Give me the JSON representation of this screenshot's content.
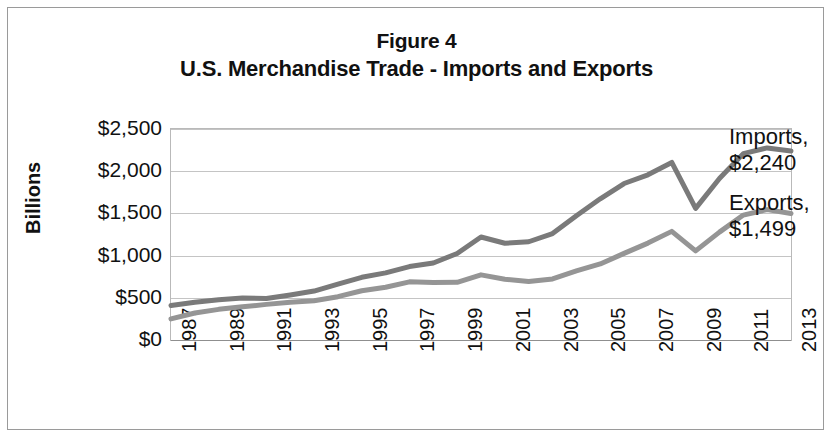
{
  "figure": {
    "title_line_1": "Figure 4",
    "title_line_2": "U.S. Merchandise Trade - Imports and Exports"
  },
  "axes": {
    "y_label": "Billions",
    "y_ticks": [
      "$0",
      "$500",
      "$1,000",
      "$1,500",
      "$2,000",
      "$2,500"
    ],
    "x_ticks": [
      "1987",
      "1989",
      "1991",
      "1993",
      "1995",
      "1997",
      "1999",
      "2001",
      "2003",
      "2005",
      "2007",
      "2009",
      "2011",
      "2013"
    ]
  },
  "callouts": {
    "imports_name": "Imports,",
    "imports_value": "$2,240",
    "exports_name": "Exports,",
    "exports_value": "$1,499"
  },
  "colors": {
    "imports_line": "#7a7a7a",
    "exports_line": "#959595",
    "gridline": "#c4c4c4",
    "plot_border": "#b9b9b9",
    "outer_border": "#9a9a9a",
    "text": "#111111"
  },
  "chart_data": {
    "type": "line",
    "xlabel": "",
    "ylabel": "Billions",
    "ylim": [
      0,
      2500
    ],
    "y_tick_step": 500,
    "grid": true,
    "legend": "data-labels-at-line-end",
    "x": [
      1987,
      1988,
      1989,
      1990,
      1991,
      1992,
      1993,
      1994,
      1995,
      1996,
      1997,
      1998,
      1999,
      2000,
      2001,
      2002,
      2003,
      2004,
      2005,
      2006,
      2007,
      2008,
      2009,
      2010,
      2011,
      2012,
      2013
    ],
    "series": [
      {
        "name": "Imports",
        "color": "#7a7a7a",
        "end_label": "Imports, $2,240",
        "values": [
          410,
          447,
          477,
          498,
          491,
          533,
          580,
          663,
          743,
          795,
          870,
          912,
          1025,
          1220,
          1146,
          1164,
          1261,
          1473,
          1673,
          1854,
          1957,
          2104,
          1559,
          1913,
          2208,
          2276,
          2240
        ]
      },
      {
        "name": "Exports",
        "color": "#959595",
        "end_label": "Exports, $1,499",
        "values": [
          250,
          320,
          363,
          393,
          422,
          448,
          465,
          513,
          584,
          625,
          689,
          682,
          684,
          772,
          719,
          693,
          724,
          818,
          901,
          1026,
          1148,
          1287,
          1056,
          1278,
          1480,
          1545,
          1499
        ]
      }
    ]
  }
}
